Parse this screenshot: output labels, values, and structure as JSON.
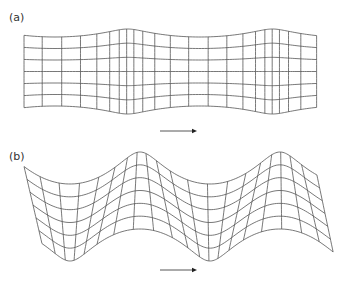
{
  "figure": {
    "panels": [
      {
        "id": "a",
        "label": "(a)",
        "label_pos": {
          "x": 9,
          "y": 11
        },
        "wave_type": "longitudinal",
        "description": "Grid compressed and dilated horizontally; vertical lines bunch in compression zones",
        "grid": {
          "x_start": 33,
          "x_end": 325,
          "y_top": 33,
          "y_bottom": 110,
          "rows": 7,
          "columns": 22,
          "wavelength": 145,
          "phase": 55,
          "horizontal_amplitude": 11,
          "edge_bulge": 4
        },
        "arrow": {
          "x1": 160,
          "x2": 197,
          "y": 131,
          "direction": "right"
        }
      },
      {
        "id": "b",
        "label": "(b)",
        "label_pos": {
          "x": 9,
          "y": 150
        },
        "wave_type": "transverse",
        "description": "Grid displaced vertically in a sinusoid; vertical lines tilt and bunch",
        "grid": {
          "x_start": 33,
          "x_end": 325,
          "y_top": 168,
          "y_bottom": 245,
          "rows": 7,
          "columns": 20,
          "wavelength": 140,
          "phase": 70,
          "vertical_amplitude": 16,
          "horizontal_amplitude": 9
        },
        "arrow": {
          "x1": 160,
          "x2": 197,
          "y": 270,
          "direction": "right"
        }
      }
    ],
    "colors": {
      "line": "#555555",
      "arrow": "#444444",
      "background": "#ffffff",
      "label": "#333333"
    }
  }
}
